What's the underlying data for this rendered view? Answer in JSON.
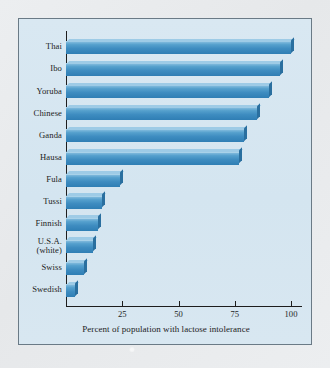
{
  "chart_data": {
    "type": "bar",
    "orientation": "horizontal",
    "title": "",
    "xlabel": "Percent of population with lactose intolerance",
    "ylabel": "",
    "xlim": [
      0,
      105
    ],
    "xticks": [
      25,
      50,
      75,
      100
    ],
    "xtick_labels": [
      "25",
      "50",
      "75",
      "100"
    ],
    "grid": false,
    "legend": false,
    "categories": [
      "Thai",
      "Ibo",
      "Yoruba",
      "Chinese",
      "Ganda",
      "Hausa",
      "Fula",
      "Tussi",
      "Finnish",
      "U.S.A. (white)",
      "Swiss",
      "Swedish"
    ],
    "category_labels": [
      "Thai",
      "Ibo",
      "Yoruba",
      "Chinese",
      "Ganda",
      "Hausa",
      "Fula",
      "Tussi",
      "Finnish",
      "U.S.A.\n(white)",
      "Swiss",
      "Swedish"
    ],
    "values": [
      100,
      95,
      90,
      85,
      79,
      77,
      24,
      16,
      14,
      12,
      8,
      4
    ],
    "bar_color": "#3e8cc0",
    "bar_top_color": "#9ecbe6",
    "bar_side_color": "#2a6f9f",
    "panel_background": "#d6e6f0",
    "page_background": "#e8eaec",
    "axis_color": "#1d1d1d"
  }
}
